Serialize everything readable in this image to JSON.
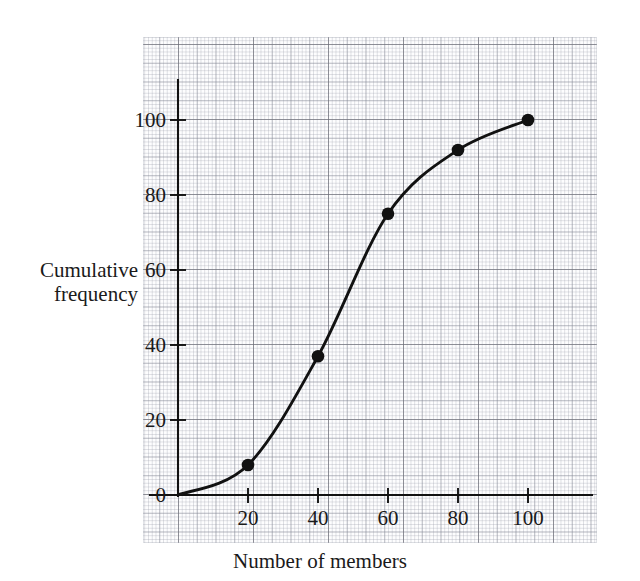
{
  "figure": {
    "kind": "cumulative-frequency-graph",
    "background": "#ffffff",
    "ink_color": "#111111"
  },
  "axis_titles": {
    "y_line1": "Cumulative",
    "y_line2": "frequency",
    "x": "Number of members"
  },
  "ticks": {
    "y": [
      "0",
      "20",
      "40",
      "60",
      "80",
      "100"
    ],
    "x": [
      "20",
      "40",
      "60",
      "80",
      "100"
    ]
  },
  "chart_data": {
    "type": "line",
    "title": "",
    "subtitle": "",
    "xlabel": "Number of members",
    "ylabel": "Cumulative frequency",
    "xlim": [
      0,
      110
    ],
    "ylim": [
      0,
      110
    ],
    "xticks": [
      20,
      40,
      60,
      80,
      100
    ],
    "yticks": [
      0,
      20,
      40,
      60,
      80,
      100
    ],
    "grid": true,
    "grid_style": "graph-paper-minor-and-major",
    "legend": "none",
    "marker": "filled-circle",
    "marker_color": "#111111",
    "line_color": "#111111",
    "x": [
      0,
      20,
      40,
      60,
      80,
      100
    ],
    "y": [
      0,
      8,
      37,
      75,
      92,
      100
    ],
    "points": [
      {
        "x": 20,
        "y": 8
      },
      {
        "x": 40,
        "y": 37
      },
      {
        "x": 60,
        "y": 75
      },
      {
        "x": 80,
        "y": 92
      },
      {
        "x": 100,
        "y": 100
      }
    ],
    "series": [
      {
        "name": "Cumulative frequency",
        "x": [
          0,
          20,
          40,
          60,
          80,
          100
        ],
        "values": [
          0,
          8,
          37,
          75,
          92,
          100
        ]
      }
    ],
    "annotations": []
  }
}
